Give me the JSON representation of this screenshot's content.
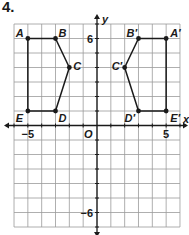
{
  "problem_number": "4.",
  "plane": {
    "x_range": [
      -6,
      6
    ],
    "y_range": [
      -7,
      7
    ],
    "origin_px": [
      97,
      125.5
    ],
    "unit_px": [
      13.83,
      14.5
    ],
    "grid_color": "#9a9a9a",
    "axis_color": "#1a1a1a",
    "axis_labels": {
      "x": "x",
      "y": "y",
      "origin": "O"
    },
    "tick_labels": [
      {
        "text": "−5",
        "x": -5,
        "axis": "x"
      },
      {
        "text": "5",
        "x": 5,
        "axis": "x"
      },
      {
        "text": "6",
        "y": 6,
        "axis": "y"
      },
      {
        "text": "−6",
        "y": -6,
        "axis": "y"
      }
    ]
  },
  "figures": [
    {
      "name": "original",
      "vertices": [
        {
          "label": "A",
          "x": -5,
          "y": 6
        },
        {
          "label": "B",
          "x": -3,
          "y": 6
        },
        {
          "label": "C",
          "x": -2,
          "y": 4
        },
        {
          "label": "D",
          "x": -3,
          "y": 1
        },
        {
          "label": "E",
          "x": -5,
          "y": 1
        }
      ]
    },
    {
      "name": "image",
      "vertices": [
        {
          "label": "A′",
          "x": 5,
          "y": 6
        },
        {
          "label": "B′",
          "x": 3,
          "y": 6
        },
        {
          "label": "C′",
          "x": 2,
          "y": 4
        },
        {
          "label": "D′",
          "x": 3,
          "y": 1
        },
        {
          "label": "E′",
          "x": 5,
          "y": 1
        }
      ]
    }
  ]
}
